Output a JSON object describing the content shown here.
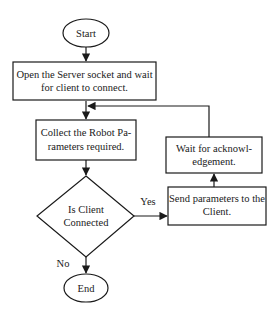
{
  "diagram": {
    "type": "flowchart",
    "nodes": {
      "start": {
        "kind": "terminator",
        "lines": [
          "Start"
        ]
      },
      "open_socket": {
        "kind": "process",
        "lines": [
          "Open the Server socket and wait",
          "for client to connect."
        ]
      },
      "collect_params": {
        "kind": "process",
        "lines": [
          "Collect the Robot Pa-",
          "rameters required."
        ]
      },
      "is_connected": {
        "kind": "decision",
        "lines": [
          "Is Client",
          "Connected"
        ]
      },
      "send_params": {
        "kind": "process",
        "lines": [
          "Send parameters to the",
          "Client."
        ]
      },
      "wait_ack": {
        "kind": "process",
        "lines": [
          "Wait for acknowl-",
          "edgement."
        ]
      },
      "end": {
        "kind": "terminator",
        "lines": [
          "End"
        ]
      }
    },
    "edges": [
      {
        "from": "start",
        "to": "open_socket",
        "label": ""
      },
      {
        "from": "open_socket",
        "to": "collect_params",
        "label": ""
      },
      {
        "from": "collect_params",
        "to": "is_connected",
        "label": ""
      },
      {
        "from": "is_connected",
        "to": "send_params",
        "label": "Yes"
      },
      {
        "from": "send_params",
        "to": "wait_ack",
        "label": ""
      },
      {
        "from": "wait_ack",
        "to": "collect_params",
        "label": ""
      },
      {
        "from": "is_connected",
        "to": "end",
        "label": "No"
      }
    ],
    "colors": {
      "stroke": "#1a1a1a",
      "fill": "#ffffff",
      "text": "#1a1a1a"
    }
  }
}
